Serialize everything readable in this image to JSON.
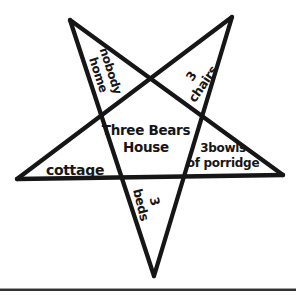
{
  "figure": {
    "background": "#ffffff",
    "ink_color": "#161616",
    "labels": {
      "center": {
        "line1": "Three Bears",
        "line2": "House"
      },
      "upper_left_arm": {
        "line1": "nobody",
        "line2": "home"
      },
      "upper_right_arm": {
        "line1": "3",
        "line2": "chairs"
      },
      "left_arm": {
        "line1": "cottage"
      },
      "right_arm": {
        "line1": "3bowls",
        "line2": "of porridge"
      },
      "bottom_arm": {
        "line1": "3",
        "line2": "beds"
      }
    },
    "star": {
      "stroke_width": 4.3,
      "points": {
        "top_left": [
          70,
          20
        ],
        "top_right": [
          232,
          17
        ],
        "left": [
          17,
          179
        ],
        "right": [
          283,
          175
        ],
        "bottom": [
          154,
          276
        ]
      },
      "edges": [
        [
          "top_left",
          "right"
        ],
        [
          "top_right",
          "left"
        ],
        [
          "left",
          "right"
        ],
        [
          "top_left",
          "bottom"
        ],
        [
          "top_right",
          "bottom"
        ]
      ]
    }
  }
}
